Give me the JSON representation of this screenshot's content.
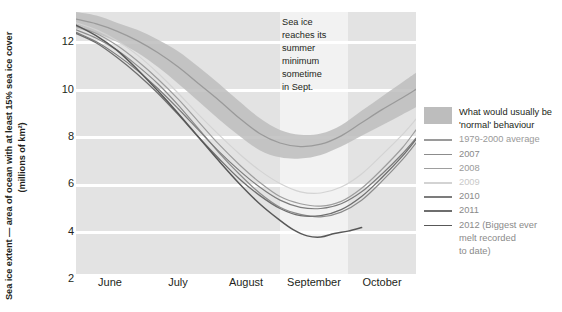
{
  "chart_data": {
    "type": "line",
    "title": "",
    "ylabel_line1": "Sea ice extent — area of ocean with at least 15% sea ice cover",
    "ylabel_line2": "(millions of km²)",
    "xlabel": "",
    "ylim": [
      2,
      13
    ],
    "yticks": [
      2,
      4,
      6,
      8,
      10,
      12
    ],
    "categories": [
      "June",
      "July",
      "August",
      "September",
      "October"
    ],
    "xlim": [
      0,
      5
    ],
    "grid": true,
    "legend_position": "right",
    "annotation": "Sea ice reaches its summer minimum sometime in Sept.",
    "band": {
      "name": "What would usually be 'normal' behaviour",
      "color": "#bdbdbd",
      "x": [
        0.0,
        0.3,
        0.6,
        0.9,
        1.2,
        1.5,
        1.8,
        2.1,
        2.4,
        2.7,
        3.0,
        3.3,
        3.6,
        3.9,
        4.2,
        4.5,
        4.8,
        5.0
      ],
      "upper": [
        13.0,
        12.85,
        12.55,
        12.25,
        11.85,
        11.35,
        10.7,
        10.0,
        9.25,
        8.55,
        8.05,
        7.85,
        7.9,
        8.25,
        8.85,
        9.45,
        10.05,
        10.45
      ],
      "lower": [
        12.3,
        12.1,
        11.75,
        11.3,
        10.7,
        10.0,
        9.25,
        8.5,
        7.8,
        7.2,
        6.9,
        6.85,
        7.0,
        7.35,
        7.8,
        8.25,
        8.7,
        9.0
      ]
    },
    "series": [
      {
        "name": "1979-2000 average",
        "color": "#9a9a9a",
        "width": 1.3,
        "x": [
          0.0,
          0.3,
          0.6,
          0.9,
          1.2,
          1.5,
          1.8,
          2.1,
          2.4,
          2.7,
          3.0,
          3.3,
          3.6,
          3.9,
          4.2,
          4.5,
          4.8,
          5.0
        ],
        "y": [
          12.7,
          12.5,
          12.2,
          11.8,
          11.3,
          10.7,
          10.0,
          9.3,
          8.55,
          7.9,
          7.5,
          7.35,
          7.45,
          7.8,
          8.35,
          8.9,
          9.4,
          9.75
        ]
      },
      {
        "name": "2007",
        "color": "#8c8c8c",
        "width": 1.2,
        "x": [
          0.0,
          0.3,
          0.6,
          0.9,
          1.2,
          1.5,
          1.8,
          2.1,
          2.4,
          2.7,
          3.0,
          3.3,
          3.6,
          3.9,
          4.2,
          4.5,
          4.8,
          5.0
        ],
        "y": [
          12.25,
          11.9,
          11.4,
          10.75,
          10.0,
          9.1,
          8.1,
          7.1,
          6.2,
          5.4,
          4.8,
          4.5,
          4.4,
          4.6,
          5.1,
          5.9,
          6.8,
          7.5
        ]
      },
      {
        "name": "2008",
        "color": "#9e9e9e",
        "width": 1.2,
        "x": [
          0.0,
          0.3,
          0.6,
          0.9,
          1.2,
          1.5,
          1.8,
          2.1,
          2.4,
          2.7,
          3.0,
          3.3,
          3.6,
          3.9,
          4.2,
          4.5,
          4.8,
          5.0
        ],
        "y": [
          12.4,
          12.1,
          11.6,
          10.95,
          10.2,
          9.35,
          8.4,
          7.45,
          6.6,
          5.85,
          5.25,
          4.95,
          4.85,
          5.05,
          5.6,
          6.4,
          7.3,
          8.05
        ]
      },
      {
        "name": "2009",
        "color": "#d3d3d3",
        "width": 1.2,
        "x": [
          0.0,
          0.3,
          0.6,
          0.9,
          1.2,
          1.5,
          1.8,
          2.1,
          2.4,
          2.7,
          3.0,
          3.3,
          3.6,
          3.9,
          4.2,
          4.5,
          4.8,
          5.0
        ],
        "y": [
          12.55,
          12.25,
          11.8,
          11.2,
          10.45,
          9.6,
          8.7,
          7.85,
          7.05,
          6.35,
          5.8,
          5.45,
          5.4,
          5.65,
          6.2,
          7.0,
          7.85,
          8.5
        ]
      },
      {
        "name": "2010",
        "color": "#7c7c7c",
        "width": 1.2,
        "x": [
          0.0,
          0.3,
          0.6,
          0.9,
          1.2,
          1.5,
          1.8,
          2.1,
          2.4,
          2.7,
          3.0,
          3.3,
          3.6,
          3.9,
          4.2,
          4.5,
          4.8,
          5.0
        ],
        "y": [
          12.15,
          11.75,
          11.2,
          10.55,
          9.8,
          8.95,
          8.05,
          7.15,
          6.35,
          5.65,
          5.1,
          4.8,
          4.75,
          4.95,
          5.45,
          6.2,
          7.05,
          7.7
        ]
      },
      {
        "name": "2011",
        "color": "#6e6e6e",
        "width": 1.3,
        "x": [
          0.0,
          0.3,
          0.6,
          0.9,
          1.2,
          1.5,
          1.8,
          2.1,
          2.4,
          2.7,
          3.0,
          3.3,
          3.6,
          3.9,
          4.2,
          4.5,
          4.8,
          5.0
        ],
        "y": [
          12.1,
          11.7,
          11.1,
          10.4,
          9.6,
          8.7,
          7.75,
          6.85,
          6.0,
          5.3,
          4.75,
          4.45,
          4.45,
          4.7,
          5.25,
          6.05,
          6.95,
          7.65
        ]
      },
      {
        "name": "2012 (Biggest ever melt recorded to date)",
        "legend_label_line1": "2012 (Biggest ever",
        "legend_label_line2": "melt recorded",
        "legend_label_line3": "to date)",
        "color": "#585858",
        "width": 1.5,
        "x": [
          0.0,
          0.3,
          0.6,
          0.9,
          1.2,
          1.5,
          1.8,
          2.1,
          2.4,
          2.7,
          3.0,
          3.2,
          3.4,
          3.6,
          3.8,
          4.0,
          4.2
        ],
        "y": [
          12.45,
          12.0,
          11.4,
          10.6,
          9.7,
          8.75,
          7.75,
          6.75,
          5.8,
          4.95,
          4.25,
          3.85,
          3.6,
          3.55,
          3.7,
          3.8,
          3.95
        ]
      }
    ]
  },
  "legend": {
    "band_label_line1": "What would usually be",
    "band_label_line2": "'normal' behaviour",
    "items": [
      {
        "label": "1979-2000 average"
      },
      {
        "label": "2007"
      },
      {
        "label": "2008"
      },
      {
        "label": "2009"
      },
      {
        "label": "2010"
      },
      {
        "label": "2011"
      },
      {
        "label": "2012 (Biggest ever"
      },
      {
        "label": "melt recorded"
      },
      {
        "label": "to date)"
      }
    ]
  },
  "annotation": {
    "line1": "Sea ice",
    "line2": "reaches its",
    "line3": "summer",
    "line4": "minimum",
    "line5": "sometime",
    "line6": "in Sept."
  },
  "axis": {
    "y_title_line1": "Sea ice extent — area of ocean with at least 15% sea ice cover",
    "y_title_line2": "(millions of km²)",
    "yticks": [
      "12",
      "10",
      "8",
      "6",
      "4",
      "2"
    ],
    "xticks": [
      "June",
      "July",
      "August",
      "September",
      "October"
    ]
  },
  "colors": {
    "band": "#bdbdbd",
    "plot_bg": "#e3e3e3",
    "plot_bg_light": "#f2f2f2",
    "gridline": "#ffffff",
    "text": "#231f20"
  }
}
